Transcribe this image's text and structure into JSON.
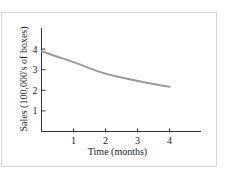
{
  "chart_data": {
    "type": "line",
    "title": "",
    "xlabel": "Time (months)",
    "ylabel": "Sales (100,000's of boxes)",
    "xlim": [
      0,
      4.9
    ],
    "ylim": [
      0,
      4.9
    ],
    "xticks": [
      1,
      2,
      3,
      4
    ],
    "yticks": [
      1,
      2,
      3,
      4
    ],
    "xtick_labels": [
      "1",
      "2",
      "3",
      "4"
    ],
    "ytick_labels": [
      "1",
      "2",
      "3",
      "4"
    ],
    "grid": false,
    "legend": null,
    "series": [
      {
        "name": "Sales",
        "color": "#9a9a9a",
        "x": [
          0,
          0.5,
          1,
          1.5,
          2,
          2.5,
          3,
          3.5,
          4
        ],
        "y": [
          3.9,
          3.62,
          3.38,
          3.06,
          2.8,
          2.62,
          2.46,
          2.3,
          2.17
        ]
      }
    ]
  }
}
